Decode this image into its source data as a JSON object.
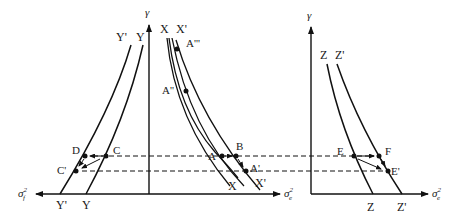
{
  "figure": {
    "left_panel": {
      "y_axis_label": "γ",
      "x_axis_left_label": "σ_f²",
      "x_axis_right_label": "σ_e²",
      "curves": [
        {
          "name": "Y'",
          "top_label": "Y'",
          "bottom_label": "Y'"
        },
        {
          "name": "Y",
          "top_label": "Y",
          "bottom_label": "Y"
        },
        {
          "name": "X",
          "top_label": "X",
          "bottom_label": "X"
        },
        {
          "name": "X'",
          "top_label": "X'",
          "bottom_label": "X'"
        }
      ],
      "points": [
        "A",
        "A'",
        "A''",
        "A'''",
        "B",
        "C",
        "C'",
        "D"
      ]
    },
    "right_panel": {
      "y_axis_label": "γ",
      "x_axis_label": "σ_e²",
      "curves": [
        {
          "name": "Z",
          "top_label": "Z",
          "bottom_label": "Z"
        },
        {
          "name": "Z'",
          "top_label": "Z'",
          "bottom_label": "Z'"
        }
      ],
      "points": [
        "E",
        "E'",
        "F"
      ]
    }
  },
  "labels": {
    "gamma_left": "γ",
    "gamma_right": "γ",
    "sigma_f": "σ",
    "sigma_f_sub": "f",
    "sigma_e": "σ",
    "sigma_e_sub": "e",
    "sigma_e2": "σ",
    "sigma_e2_sub": "e",
    "sq": "2",
    "Yp_top": "Y'",
    "Y_top": "Y",
    "X_top": "X",
    "Xp_top": "X'",
    "A3": "A'''",
    "A2": "A''",
    "A": "A",
    "Ap": "A'",
    "B": "B",
    "C": "C",
    "Cp": "C'",
    "D": "D",
    "Yp_bot": "Y'",
    "Y_bot": "Y",
    "X_bot": "X",
    "Xp_bot": "X'",
    "Z_top": "Z",
    "Zp_top": "Z'",
    "E": "E",
    "F": "F",
    "Ep": "E'",
    "Z_bot": "Z",
    "Zp_bot": "Z'"
  }
}
